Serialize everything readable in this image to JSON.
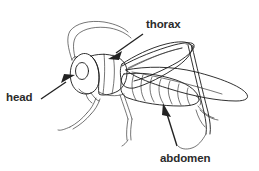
{
  "diagram": {
    "style": "black-and-white line drawing",
    "background_color": "#ffffff",
    "ink_color": "#1a1a1a",
    "label_color": "#2b2b2b",
    "labels": [
      {
        "id": "thorax",
        "text": "thorax",
        "text_x": 146,
        "text_y": 28,
        "arrow_from": [
          143,
          33
        ],
        "arrow_to": [
          110,
          57
        ],
        "points_at": "thorax-segment"
      },
      {
        "id": "head",
        "text": "head",
        "text_x": 6,
        "text_y": 101,
        "arrow_from": [
          40,
          98
        ],
        "arrow_to": [
          74,
          76
        ],
        "points_at": "head-segment"
      },
      {
        "id": "abdomen",
        "text": "abdomen",
        "text_x": 160,
        "text_y": 162,
        "arrow_from": [
          176,
          145
        ],
        "arrow_to": [
          163,
          104
        ],
        "points_at": "abdomen-segment"
      }
    ],
    "body_parts": [
      {
        "id": "antennae",
        "name": "antennae",
        "count": 2
      },
      {
        "id": "head-segment",
        "name": "head"
      },
      {
        "id": "eye",
        "name": "compound eye"
      },
      {
        "id": "thorax-segment",
        "name": "thorax"
      },
      {
        "id": "abdomen-segment",
        "name": "abdomen",
        "segments": 7
      },
      {
        "id": "forewing",
        "name": "forewing"
      },
      {
        "id": "hindwing",
        "name": "hind wing"
      },
      {
        "id": "foreleg",
        "name": "foreleg"
      },
      {
        "id": "midleg",
        "name": "midleg"
      },
      {
        "id": "hindleg",
        "name": "hind leg"
      }
    ]
  }
}
